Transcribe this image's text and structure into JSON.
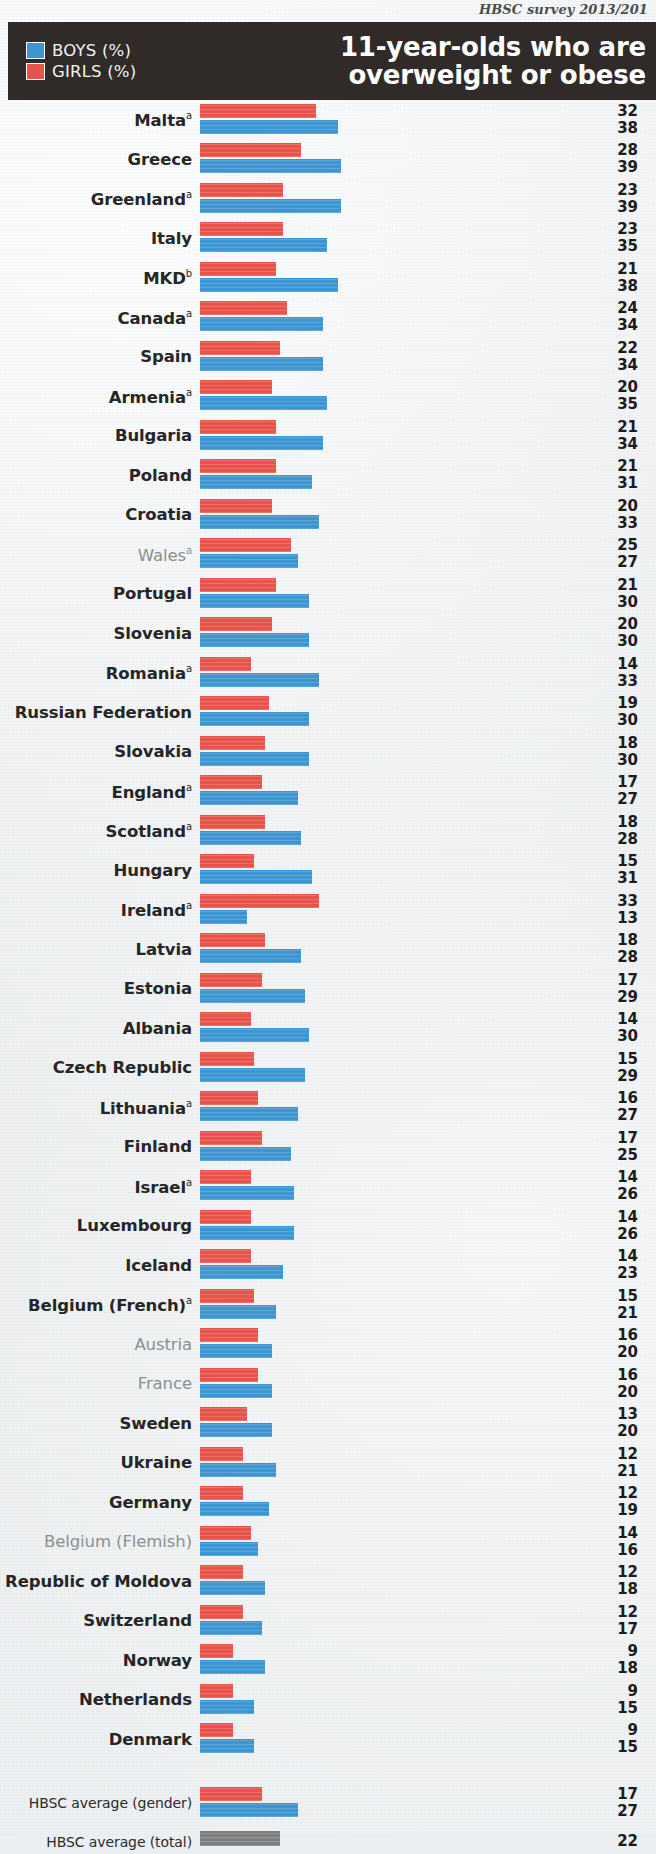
{
  "source_note": "HBSC survey 2013/201",
  "header": {
    "title_line1": "11-year-olds who are",
    "title_line2": "overweight or obese",
    "legend": [
      {
        "key": "boys",
        "label": "BOYS (%)",
        "color": "#3d95d1"
      },
      {
        "key": "girls",
        "label": "GIRLS (%)",
        "color": "#e8544b"
      }
    ]
  },
  "averages": {
    "gender_label": "HBSC average (gender)",
    "total_label": "HBSC average (total)",
    "gender_girls": 17,
    "gender_boys": 27,
    "total": 22,
    "total_color": "#7f7f7f"
  },
  "chart_data": {
    "type": "bar",
    "orientation": "horizontal",
    "title": "11-year-olds who are overweight or obese",
    "subtitle": "HBSC survey 2013/201",
    "xlabel": "%",
    "ylabel": "",
    "grid": false,
    "legend_position": "top-left",
    "xlim": [
      0,
      40
    ],
    "note_a": "a",
    "note_b": "b",
    "categories": [
      "Malta",
      "Greece",
      "Greenland",
      "Italy",
      "MKD",
      "Canada",
      "Spain",
      "Armenia",
      "Bulgaria",
      "Poland",
      "Croatia",
      "Wales",
      "Portugal",
      "Slovenia",
      "Romania",
      "Russian Federation",
      "Slovakia",
      "England",
      "Scotland",
      "Hungary",
      "Ireland",
      "Latvia",
      "Estonia",
      "Albania",
      "Czech Republic",
      "Lithuania",
      "Finland",
      "Israel",
      "Luxembourg",
      "Iceland",
      "Belgium (French)",
      "Austria",
      "France",
      "Sweden",
      "Ukraine",
      "Germany",
      "Belgium (Flemish)",
      "Republic of Moldova",
      "Switzerland",
      "Norway",
      "Netherlands",
      "Denmark"
    ],
    "series": [
      {
        "name": "GIRLS (%)",
        "color": "#e8544b",
        "values": [
          32,
          28,
          23,
          23,
          21,
          24,
          22,
          20,
          21,
          21,
          20,
          25,
          21,
          20,
          14,
          19,
          18,
          17,
          18,
          15,
          33,
          18,
          17,
          14,
          15,
          16,
          17,
          14,
          14,
          14,
          15,
          16,
          16,
          13,
          12,
          12,
          14,
          12,
          12,
          9,
          9,
          9
        ]
      },
      {
        "name": "BOYS (%)",
        "color": "#3d95d1",
        "values": [
          38,
          39,
          39,
          35,
          38,
          34,
          34,
          35,
          34,
          31,
          33,
          27,
          30,
          30,
          33,
          30,
          30,
          27,
          28,
          31,
          13,
          28,
          29,
          30,
          29,
          27,
          25,
          26,
          26,
          23,
          21,
          20,
          20,
          20,
          21,
          19,
          16,
          18,
          17,
          18,
          15,
          15
        ]
      }
    ],
    "hbsc_average_gender": {
      "girls": 17,
      "boys": 27
    },
    "hbsc_average_total": 22
  },
  "rows": [
    {
      "name": "Malta",
      "sup": "a",
      "muted": false,
      "girls": 32,
      "boys": 38
    },
    {
      "name": "Greece",
      "sup": "",
      "muted": false,
      "girls": 28,
      "boys": 39
    },
    {
      "name": "Greenland",
      "sup": "a",
      "muted": false,
      "girls": 23,
      "boys": 39
    },
    {
      "name": "Italy",
      "sup": "",
      "muted": false,
      "girls": 23,
      "boys": 35
    },
    {
      "name": "MKD",
      "sup": "b",
      "muted": false,
      "girls": 21,
      "boys": 38
    },
    {
      "name": "Canada",
      "sup": "a",
      "muted": false,
      "girls": 24,
      "boys": 34
    },
    {
      "name": "Spain",
      "sup": "",
      "muted": false,
      "girls": 22,
      "boys": 34
    },
    {
      "name": "Armenia",
      "sup": "a",
      "muted": false,
      "girls": 20,
      "boys": 35
    },
    {
      "name": "Bulgaria",
      "sup": "",
      "muted": false,
      "girls": 21,
      "boys": 34
    },
    {
      "name": "Poland",
      "sup": "",
      "muted": false,
      "girls": 21,
      "boys": 31
    },
    {
      "name": "Croatia",
      "sup": "",
      "muted": false,
      "girls": 20,
      "boys": 33
    },
    {
      "name": "Wales",
      "sup": "a",
      "muted": true,
      "girls": 25,
      "boys": 27
    },
    {
      "name": "Portugal",
      "sup": "",
      "muted": false,
      "girls": 21,
      "boys": 30
    },
    {
      "name": "Slovenia",
      "sup": "",
      "muted": false,
      "girls": 20,
      "boys": 30
    },
    {
      "name": "Romania",
      "sup": "a",
      "muted": false,
      "girls": 14,
      "boys": 33
    },
    {
      "name": "Russian Federation",
      "sup": "",
      "muted": false,
      "girls": 19,
      "boys": 30
    },
    {
      "name": "Slovakia",
      "sup": "",
      "muted": false,
      "girls": 18,
      "boys": 30
    },
    {
      "name": "England",
      "sup": "a",
      "muted": false,
      "girls": 17,
      "boys": 27
    },
    {
      "name": "Scotland",
      "sup": "a",
      "muted": false,
      "girls": 18,
      "boys": 28
    },
    {
      "name": "Hungary",
      "sup": "",
      "muted": false,
      "girls": 15,
      "boys": 31
    },
    {
      "name": "Ireland",
      "sup": "a",
      "muted": false,
      "girls": 33,
      "boys": 13
    },
    {
      "name": "Latvia",
      "sup": "",
      "muted": false,
      "girls": 18,
      "boys": 28
    },
    {
      "name": "Estonia",
      "sup": "",
      "muted": false,
      "girls": 17,
      "boys": 29
    },
    {
      "name": "Albania",
      "sup": "",
      "muted": false,
      "girls": 14,
      "boys": 30
    },
    {
      "name": "Czech Republic",
      "sup": "",
      "muted": false,
      "girls": 15,
      "boys": 29
    },
    {
      "name": "Lithuania",
      "sup": "a",
      "muted": false,
      "girls": 16,
      "boys": 27
    },
    {
      "name": "Finland",
      "sup": "",
      "muted": false,
      "girls": 17,
      "boys": 25
    },
    {
      "name": "Israel",
      "sup": "a",
      "muted": false,
      "girls": 14,
      "boys": 26
    },
    {
      "name": "Luxembourg",
      "sup": "",
      "muted": false,
      "girls": 14,
      "boys": 26
    },
    {
      "name": "Iceland",
      "sup": "",
      "muted": false,
      "girls": 14,
      "boys": 23
    },
    {
      "name": "Belgium (French)",
      "sup": "a",
      "muted": false,
      "girls": 15,
      "boys": 21
    },
    {
      "name": "Austria",
      "sup": "",
      "muted": true,
      "girls": 16,
      "boys": 20
    },
    {
      "name": "France",
      "sup": "",
      "muted": true,
      "girls": 16,
      "boys": 20
    },
    {
      "name": "Sweden",
      "sup": "",
      "muted": false,
      "girls": 13,
      "boys": 20
    },
    {
      "name": "Ukraine",
      "sup": "",
      "muted": false,
      "girls": 12,
      "boys": 21
    },
    {
      "name": "Germany",
      "sup": "",
      "muted": false,
      "girls": 12,
      "boys": 19
    },
    {
      "name": "Belgium (Flemish)",
      "sup": "",
      "muted": true,
      "girls": 14,
      "boys": 16
    },
    {
      "name": "Republic of Moldova",
      "sup": "",
      "muted": false,
      "girls": 12,
      "boys": 18
    },
    {
      "name": "Switzerland",
      "sup": "",
      "muted": false,
      "girls": 12,
      "boys": 17
    },
    {
      "name": "Norway",
      "sup": "",
      "muted": false,
      "girls": 9,
      "boys": 18
    },
    {
      "name": "Netherlands",
      "sup": "",
      "muted": false,
      "girls": 9,
      "boys": 15
    },
    {
      "name": "Denmark",
      "sup": "",
      "muted": false,
      "girls": 9,
      "boys": 15
    }
  ]
}
